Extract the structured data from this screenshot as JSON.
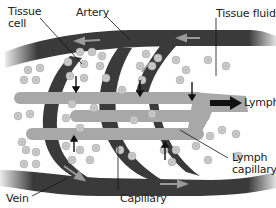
{
  "diagram": {
    "labels": {
      "tissue_cell_line1": "Tissue",
      "tissue_cell_line2": "cell",
      "artery": "Artery",
      "tissue_fluid": "Tissue fluid",
      "lymph": "Lymph",
      "lymph_capillary_line1": "Lymph",
      "lymph_capillary_line2": "capillary",
      "vein": "Vein",
      "capillary": "Capillary"
    },
    "colors": {
      "vessel_dark": "#3a3a3a",
      "lymph_vessel": "#a8a8a8",
      "cell_fill": "#c8c8c8",
      "cell_nucleus": "#555555",
      "arrow": "#111111",
      "flow_arrow": "#9a9a9a",
      "background": "#ffffff"
    }
  }
}
